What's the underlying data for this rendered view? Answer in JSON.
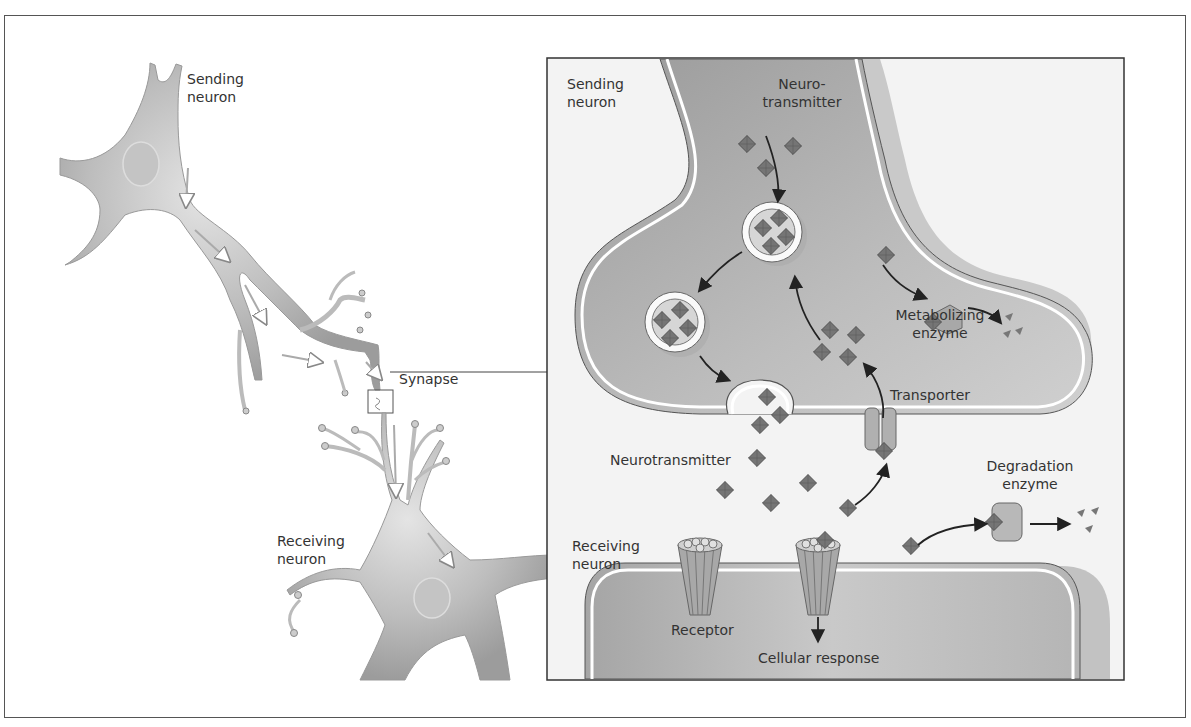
{
  "figure": {
    "overview": {
      "sending_neuron_label": "Sending\nneuron",
      "receiving_neuron_label": "Receiving\nneuron",
      "synapse_label": "Synapse"
    },
    "detail_panel": {
      "sending_neuron_label": "Sending\nneuron",
      "receiving_neuron_label": "Receiving\nneuron",
      "neurotransmitter_top_label": "Neuro-\ntransmitter",
      "neurotransmitter_cleft_label": "Neurotransmitter",
      "metabolizing_enzyme_label": "Metabolizing\nenzyme",
      "transporter_label": "Transporter",
      "degradation_enzyme_label": "Degradation\nenzyme",
      "receptor_label": "Receptor",
      "cellular_response_label": "Cellular response"
    },
    "colors": {
      "membrane_fill": "#b9b9b9",
      "membrane_dark": "#9a9a9a",
      "panel_bg": "#f3f3f3",
      "molecule": "#707070",
      "line": "#222222"
    }
  }
}
